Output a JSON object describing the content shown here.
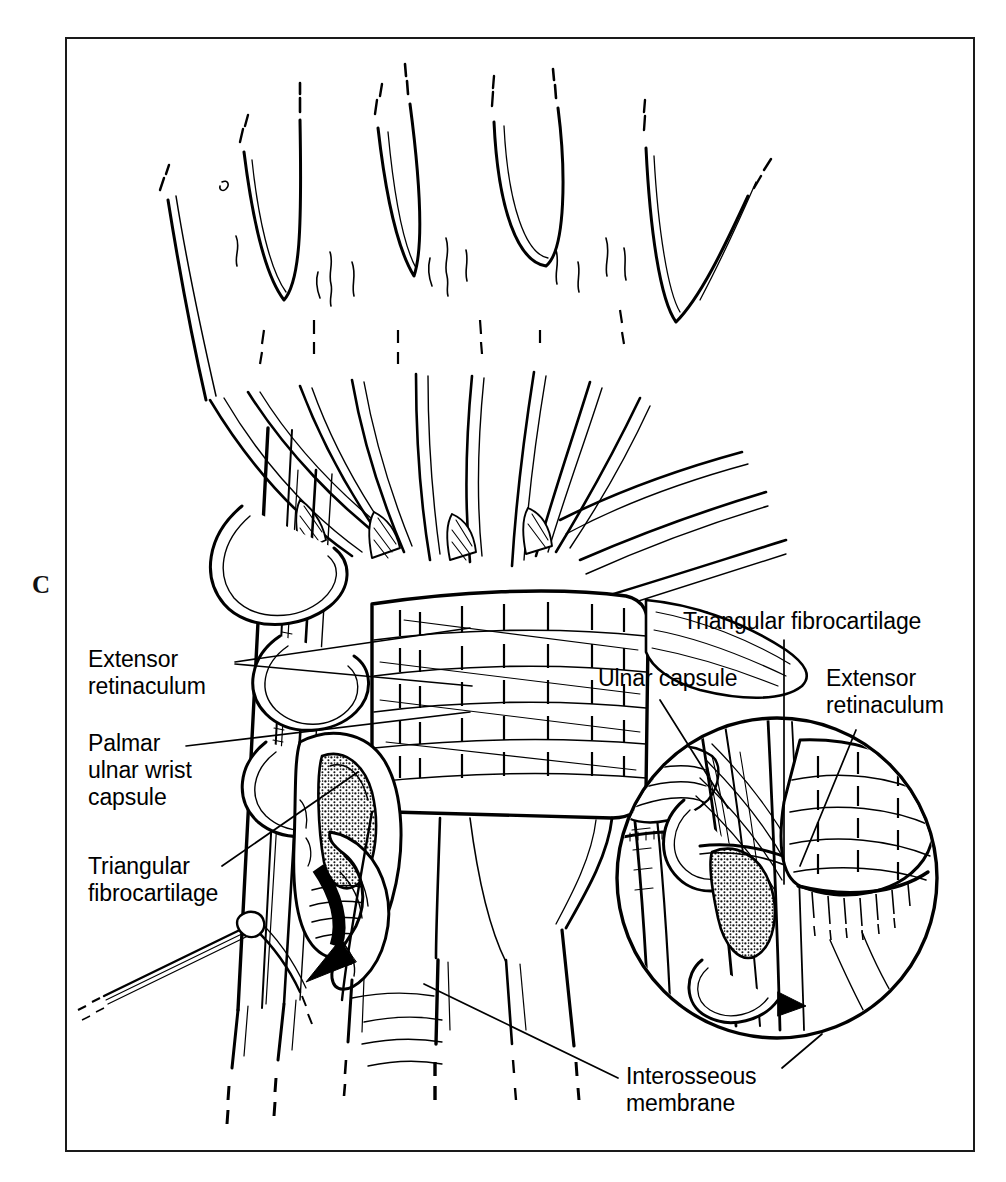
{
  "figure": {
    "panel_letter": "C",
    "type": "anatomical line illustration",
    "frame": {
      "stroke_color": "#1a1a1a",
      "background": "#ffffff"
    }
  },
  "labels": {
    "left": [
      {
        "id": "extensor-retinaculum-left",
        "text": "Extensor\nretinaculum",
        "x": 88,
        "y": 648,
        "leaders": [
          {
            "x1": 235,
            "y1": 662,
            "x2": 470,
            "y2": 630
          },
          {
            "x1": 235,
            "y1": 664,
            "x2": 472,
            "y2": 683
          }
        ]
      },
      {
        "id": "palmar-ulnar-wrist-capsule",
        "text": "Palmar\nulnar wrist\ncapsule",
        "x": 88,
        "y": 732,
        "leaders": [
          {
            "x1": 185,
            "y1": 745,
            "x2": 470,
            "y2": 712
          }
        ]
      },
      {
        "id": "triangular-fibrocartilage-left",
        "text": "Triangular\nfibrocartilage",
        "x": 88,
        "y": 855,
        "leaders": [
          {
            "x1": 222,
            "y1": 866,
            "x2": 357,
            "y2": 772
          }
        ]
      }
    ],
    "right": [
      {
        "id": "triangular-fibrocartilage-inset",
        "text": "Triangular fibrocartilage",
        "x": 685,
        "y": 610,
        "leaders": [
          {
            "x1": 783,
            "y1": 640,
            "x2": 783,
            "y2": 880
          }
        ]
      },
      {
        "id": "ulnar-capsule",
        "text": "Ulnar capsule",
        "x": 600,
        "y": 668,
        "leaders": [
          {
            "x1": 660,
            "y1": 700,
            "x2": 727,
            "y2": 806
          }
        ]
      },
      {
        "id": "extensor-retinaculum-inset",
        "text": "Extensor\nretinaculum",
        "x": 828,
        "y": 668,
        "leaders": [
          {
            "x1": 853,
            "y1": 728,
            "x2": 800,
            "y2": 862
          }
        ]
      },
      {
        "id": "interosseous-membrane",
        "text": "Interosseous\nmembrane",
        "x": 628,
        "y": 1066,
        "leaders": [
          {
            "x1": 620,
            "y1": 1080,
            "x2": 424,
            "y2": 985
          },
          {
            "x1": 778,
            "y1": 1070,
            "x2": 820,
            "y2": 1036
          }
        ]
      }
    ]
  },
  "inset": {
    "id": "magnified-detail-circle",
    "center_x": 777,
    "center_y": 878,
    "radius": 161,
    "stroke_width": 3
  },
  "colors": {
    "ink": "#000000",
    "frame": "#1a1a1a",
    "paper": "#ffffff"
  }
}
